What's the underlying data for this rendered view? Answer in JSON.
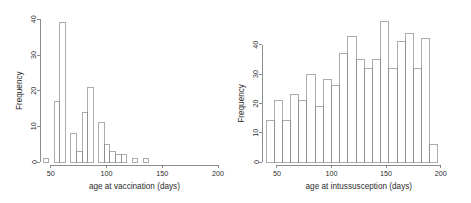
{
  "figure": {
    "background": "#ffffff",
    "foreground": "#5d5d5d",
    "panel_count": 2
  },
  "chart_data": [
    {
      "type": "bar",
      "title": "",
      "subtitle": "",
      "xlabel": "age at vaccination (days)",
      "ylabel": "Frequency",
      "xlim": [
        43,
        196
      ],
      "ylim": [
        0,
        40
      ],
      "xticks": [
        50,
        100,
        150,
        200
      ],
      "xtick_labels": [
        "50",
        "100",
        "150",
        "200"
      ],
      "yticks": [
        0,
        10,
        20,
        30,
        40
      ],
      "ytick_labels": [
        "0",
        "10",
        "20",
        "30",
        "40"
      ],
      "grid": false,
      "legend": false,
      "bin_width": 5,
      "bin_start": 43,
      "bin_edges": [
        43,
        48,
        53,
        58,
        63,
        68,
        73,
        78,
        83,
        88,
        93,
        98,
        103,
        108,
        113,
        118,
        123,
        128,
        133,
        138,
        143
      ],
      "categories": [
        "43-48",
        "48-53",
        "53-58",
        "58-63",
        "63-68",
        "68-73",
        "73-78",
        "78-83",
        "83-88",
        "88-93",
        "93-98",
        "98-103",
        "103-108",
        "108-113",
        "113-118",
        "118-123",
        "123-128",
        "128-133",
        "133-138",
        "138-143"
      ],
      "values": [
        1,
        0,
        17,
        39,
        0,
        8,
        3,
        14,
        21,
        0,
        11,
        5,
        3,
        2,
        2,
        0,
        1,
        0,
        1,
        0
      ],
      "bars": [
        {
          "x0": 43,
          "x1": 48,
          "height": 1
        },
        {
          "x0": 53,
          "x1": 58,
          "height": 17
        },
        {
          "x0": 58,
          "x1": 63,
          "height": 39
        },
        {
          "x0": 68,
          "x1": 73,
          "height": 8
        },
        {
          "x0": 73,
          "x1": 78,
          "height": 3
        },
        {
          "x0": 78,
          "x1": 83,
          "height": 14
        },
        {
          "x0": 83,
          "x1": 88,
          "height": 21
        },
        {
          "x0": 93,
          "x1": 98,
          "height": 11
        },
        {
          "x0": 98,
          "x1": 103,
          "height": 5
        },
        {
          "x0": 103,
          "x1": 108,
          "height": 3
        },
        {
          "x0": 108,
          "x1": 113,
          "height": 2
        },
        {
          "x0": 113,
          "x1": 118,
          "height": 2
        },
        {
          "x0": 123,
          "x1": 128,
          "height": 1
        },
        {
          "x0": 133,
          "x1": 138,
          "height": 1
        }
      ]
    },
    {
      "type": "bar",
      "title": "",
      "subtitle": "",
      "xlabel": "age at intussusception (days)",
      "ylabel": "Frequency",
      "xlim": [
        40,
        200
      ],
      "ylim": [
        0,
        48
      ],
      "xticks": [
        50,
        100,
        150,
        200
      ],
      "xtick_labels": [
        "50",
        "100",
        "150",
        "200"
      ],
      "yticks": [
        0,
        10,
        20,
        30,
        40
      ],
      "ytick_labels": [
        "0",
        "10",
        "20",
        "30",
        "40"
      ],
      "grid": false,
      "legend": false,
      "bin_width": 7.5,
      "bin_start": 40,
      "bin_edges": [
        40,
        47.5,
        55,
        62.5,
        70,
        77.5,
        85,
        92.5,
        100,
        107.5,
        115,
        122.5,
        130,
        137.5,
        145,
        152.5,
        160,
        167.5,
        175,
        182.5,
        190
      ],
      "categories": [
        "40-47.5",
        "47.5-55",
        "55-62.5",
        "62.5-70",
        "70-77.5",
        "77.5-85",
        "85-92.5",
        "92.5-100",
        "100-107.5",
        "107.5-115",
        "115-122.5",
        "122.5-130",
        "130-137.5",
        "137.5-145",
        "145-152.5",
        "152.5-160",
        "160-167.5",
        "167.5-175",
        "175-182.5",
        "182.5-190"
      ],
      "values": [
        14,
        21,
        14,
        23,
        21,
        30,
        19,
        28,
        26,
        37,
        43,
        35,
        32,
        35,
        48,
        32,
        41,
        44,
        32,
        42
      ],
      "bars": [
        {
          "x0": 40,
          "x1": 47.5,
          "height": 14
        },
        {
          "x0": 47.5,
          "x1": 55,
          "height": 21
        },
        {
          "x0": 55,
          "x1": 62.5,
          "height": 14
        },
        {
          "x0": 62.5,
          "x1": 70,
          "height": 23
        },
        {
          "x0": 70,
          "x1": 77.5,
          "height": 21
        },
        {
          "x0": 77.5,
          "x1": 85,
          "height": 30
        },
        {
          "x0": 85,
          "x1": 92.5,
          "height": 19
        },
        {
          "x0": 92.5,
          "x1": 100,
          "height": 28
        },
        {
          "x0": 100,
          "x1": 107.5,
          "height": 26
        },
        {
          "x0": 107.5,
          "x1": 115,
          "height": 37
        },
        {
          "x0": 115,
          "x1": 122.5,
          "height": 43
        },
        {
          "x0": 122.5,
          "x1": 130,
          "height": 35
        },
        {
          "x0": 130,
          "x1": 137.5,
          "height": 32
        },
        {
          "x0": 137.5,
          "x1": 145,
          "height": 35
        },
        {
          "x0": 145,
          "x1": 152.5,
          "height": 48
        },
        {
          "x0": 152.5,
          "x1": 160,
          "height": 32
        },
        {
          "x0": 160,
          "x1": 167.5,
          "height": 41
        },
        {
          "x0": 167.5,
          "x1": 175,
          "height": 44
        },
        {
          "x0": 175,
          "x1": 182.5,
          "height": 32
        },
        {
          "x0": 182.5,
          "x1": 190,
          "height": 42
        },
        {
          "x0": 190,
          "x1": 197.5,
          "height": 6
        }
      ]
    }
  ]
}
